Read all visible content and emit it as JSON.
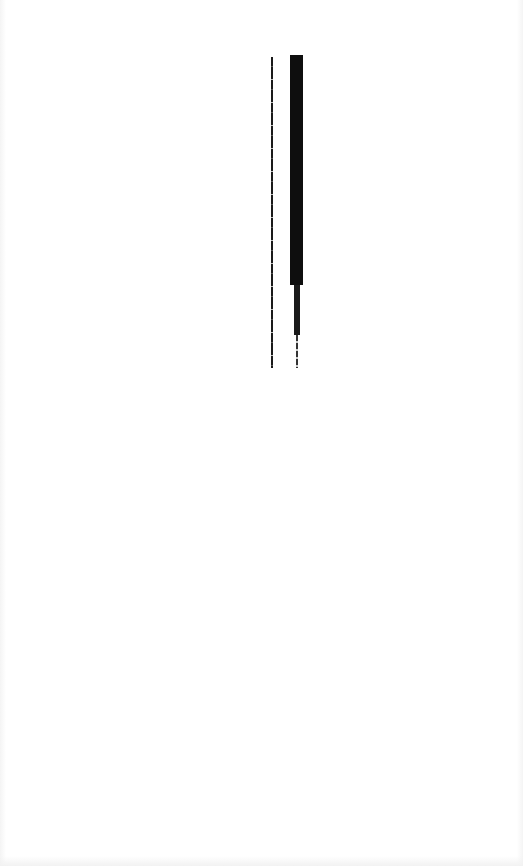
{
  "page": {
    "background": "#ffffff"
  },
  "marks": [
    {
      "name": "thin-vertical-line",
      "color": "#1a1a1a"
    },
    {
      "name": "thick-vertical-bar",
      "color": "#0e0e0e"
    }
  ]
}
